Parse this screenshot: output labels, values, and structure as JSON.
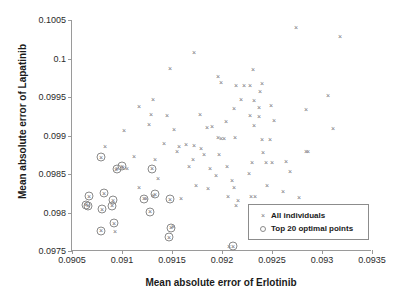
{
  "chart_data": {
    "type": "scatter",
    "title": "",
    "xlabel": "Mean absolute error of Erlotinib",
    "ylabel": "Mean absolute error of Lapatinib",
    "xlim": [
      0.0905,
      0.0935
    ],
    "ylim": [
      0.0975,
      0.1005
    ],
    "xticks": [
      "0.0905",
      "0.091",
      "0.0915",
      "0.092",
      "0.0925",
      "0.093",
      "0.0935"
    ],
    "xtick_values": [
      0.0905,
      0.091,
      0.0915,
      0.092,
      0.0925,
      0.093,
      0.0935
    ],
    "yticks": [
      "0.0975",
      "0.098",
      "0.0985",
      "0.099",
      "0.0995",
      "0.1",
      "0.1005"
    ],
    "ytick_values": [
      0.0975,
      0.098,
      0.0985,
      0.099,
      0.0995,
      0.1,
      0.1005
    ],
    "grid": false,
    "legend_position": "lower right",
    "marker_color": "#777777",
    "ring_color": "#8a8a8a",
    "axis_color": "#9a9a9a",
    "series": [
      {
        "name": "All individuals",
        "marker": "x",
        "points": [
          [
            0.09274,
            0.10041
          ],
          [
            0.09318,
            0.10029
          ],
          [
            0.09172,
            0.10008
          ],
          [
            0.09199,
            0.09969
          ],
          [
            0.09148,
            0.09988
          ],
          [
            0.09196,
            0.09977
          ],
          [
            0.09231,
            0.09987
          ],
          [
            0.09306,
            0.09952
          ],
          [
            0.09238,
            0.09958
          ],
          [
            0.09214,
            0.09966
          ],
          [
            0.09222,
            0.09965
          ],
          [
            0.09228,
            0.09965
          ],
          [
            0.0924,
            0.09968
          ],
          [
            0.09131,
            0.09947
          ],
          [
            0.09219,
            0.09948
          ],
          [
            0.09232,
            0.09946
          ],
          [
            0.09284,
            0.09934
          ],
          [
            0.09212,
            0.09936
          ],
          [
            0.09237,
            0.09937
          ],
          [
            0.09249,
            0.09939
          ],
          [
            0.09117,
            0.09938
          ],
          [
            0.09252,
            0.0992
          ],
          [
            0.09311,
            0.0991
          ],
          [
            0.09228,
            0.09926
          ],
          [
            0.09237,
            0.09925
          ],
          [
            0.09129,
            0.09928
          ],
          [
            0.09145,
            0.09927
          ],
          [
            0.09178,
            0.09928
          ],
          [
            0.0919,
            0.09912
          ],
          [
            0.09204,
            0.09919
          ],
          [
            0.09127,
            0.09915
          ],
          [
            0.09232,
            0.09914
          ],
          [
            0.09102,
            0.09907
          ],
          [
            0.09152,
            0.09908
          ],
          [
            0.09185,
            0.09911
          ],
          [
            0.09196,
            0.09898
          ],
          [
            0.09199,
            0.09897
          ],
          [
            0.09202,
            0.09897
          ],
          [
            0.09213,
            0.09898
          ],
          [
            0.0924,
            0.09896
          ],
          [
            0.09248,
            0.09896
          ],
          [
            0.09284,
            0.0988
          ],
          [
            0.09286,
            0.0988
          ],
          [
            0.09142,
            0.0989
          ],
          [
            0.09157,
            0.09887
          ],
          [
            0.09164,
            0.09889
          ],
          [
            0.09172,
            0.09888
          ],
          [
            0.09179,
            0.09884
          ],
          [
            0.09083,
            0.09886
          ],
          [
            0.09112,
            0.09874
          ],
          [
            0.09155,
            0.0988
          ],
          [
            0.09182,
            0.09876
          ],
          [
            0.09197,
            0.09876
          ],
          [
            0.09133,
            0.0987
          ],
          [
            0.09171,
            0.0987
          ],
          [
            0.09241,
            0.09879
          ],
          [
            0.0925,
            0.09866
          ],
          [
            0.09264,
            0.09867
          ],
          [
            0.0923,
            0.09866
          ],
          [
            0.09244,
            0.09866
          ],
          [
            0.09105,
            0.09858
          ],
          [
            0.09167,
            0.09861
          ],
          [
            0.09188,
            0.09858
          ],
          [
            0.09205,
            0.0986
          ],
          [
            0.09094,
            0.09857
          ],
          [
            0.09101,
            0.09859
          ],
          [
            0.09227,
            0.09851
          ],
          [
            0.09268,
            0.09854
          ],
          [
            0.09194,
            0.09849
          ],
          [
            0.09136,
            0.09845
          ],
          [
            0.0921,
            0.09842
          ],
          [
            0.09245,
            0.09836
          ],
          [
            0.09174,
            0.09836
          ],
          [
            0.09117,
            0.09833
          ],
          [
            0.09212,
            0.09833
          ],
          [
            0.09186,
            0.09832
          ],
          [
            0.09261,
            0.09828
          ],
          [
            0.09229,
            0.09822
          ],
          [
            0.09233,
            0.09822
          ],
          [
            0.09206,
            0.09821
          ],
          [
            0.09216,
            0.09816
          ],
          [
            0.09131,
            0.09823
          ],
          [
            0.09159,
            0.09819
          ],
          [
            0.09124,
            0.09819
          ],
          [
            0.09277,
            0.0982
          ],
          [
            0.09214,
            0.0981
          ],
          [
            0.09253,
            0.09799
          ],
          [
            0.09261,
            0.09793
          ],
          [
            0.09236,
            0.09784
          ],
          [
            0.09151,
            0.09782
          ],
          [
            0.09093,
            0.09776
          ],
          [
            0.09207,
            0.09757
          ]
        ]
      },
      {
        "name": "Top 20 optimal points",
        "marker": "o",
        "points": [
          [
            0.09067,
            0.09821
          ],
          [
            0.09064,
            0.0981
          ],
          [
            0.09066,
            0.09809
          ],
          [
            0.0908,
            0.09804
          ],
          [
            0.09082,
            0.09825
          ],
          [
            0.09079,
            0.09872
          ],
          [
            0.09095,
            0.09857
          ],
          [
            0.091,
            0.0986
          ],
          [
            0.09091,
            0.09816
          ],
          [
            0.0909,
            0.09809
          ],
          [
            0.09122,
            0.09818
          ],
          [
            0.09128,
            0.09801
          ],
          [
            0.09148,
            0.09817
          ],
          [
            0.0913,
            0.09857
          ],
          [
            0.09133,
            0.09824
          ],
          [
            0.09092,
            0.09786
          ],
          [
            0.09079,
            0.09776
          ],
          [
            0.09149,
            0.0978
          ],
          [
            0.09147,
            0.09768
          ],
          [
            0.09211,
            0.09756
          ]
        ]
      }
    ]
  },
  "legend": {
    "items": [
      {
        "label": "All individuals",
        "symbol": "cross-marker"
      },
      {
        "label": "Top 20 optimal points",
        "symbol": "ring-marker"
      }
    ]
  }
}
